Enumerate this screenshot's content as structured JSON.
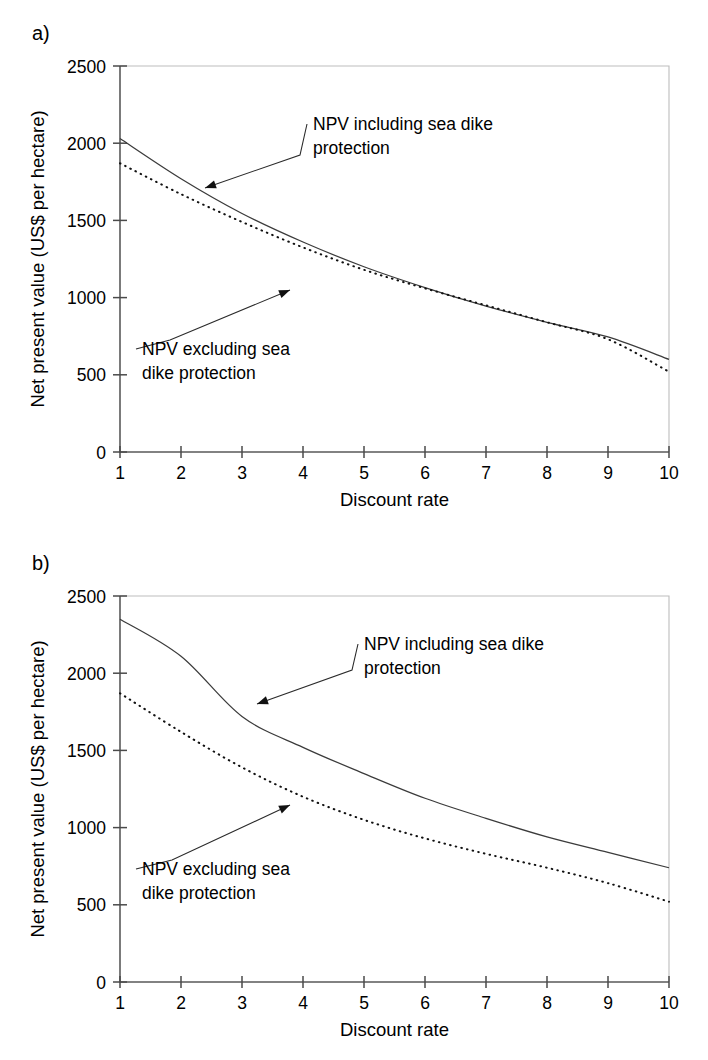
{
  "figure": {
    "panels": [
      {
        "tag": "a)",
        "xlabel": "Discount rate",
        "ylabel": "Net present value (US$ per hectare)",
        "annotations": [
          {
            "line1": "NPV including sea dike",
            "line2": "protection"
          },
          {
            "line1": "NPV excluding sea",
            "line2": "dike protection"
          }
        ]
      },
      {
        "tag": "b)",
        "xlabel": "Discount rate",
        "ylabel": "Net present value (US$ per hectare)",
        "annotations": [
          {
            "line1": "NPV including sea dike",
            "line2": "protection"
          },
          {
            "line1": "NPV excluding sea",
            "line2": "dike protection"
          }
        ]
      }
    ]
  },
  "chart_data": [
    {
      "type": "line",
      "panel": "a)",
      "title": "",
      "xlabel": "Discount rate",
      "ylabel": "Net present value (US$ per hectare)",
      "xlim": [
        1,
        10
      ],
      "ylim": [
        0,
        2500
      ],
      "xticks": [
        1,
        2,
        3,
        4,
        5,
        6,
        7,
        8,
        9,
        10
      ],
      "xticklabels": [
        "1",
        "2",
        "3",
        "4",
        "5",
        "6",
        "7",
        "8",
        "9",
        "10"
      ],
      "yticks": [
        0,
        500,
        1000,
        1500,
        2000,
        2500
      ],
      "yticklabels": [
        "0",
        "500",
        "1000",
        "1500",
        "2000",
        "2500"
      ],
      "grid": false,
      "legend": "annotations-with-leader-lines",
      "x": [
        1,
        2,
        3,
        4,
        5,
        6,
        7,
        8,
        9,
        10
      ],
      "series": [
        {
          "name": "NPV including sea dike protection",
          "style": "solid",
          "values": [
            2030,
            1770,
            1545,
            1360,
            1200,
            1065,
            945,
            840,
            745,
            600
          ]
        },
        {
          "name": "NPV excluding sea dike protection",
          "style": "dotted",
          "values": [
            1870,
            1670,
            1490,
            1325,
            1180,
            1060,
            950,
            840,
            730,
            520
          ]
        }
      ]
    },
    {
      "type": "line",
      "panel": "b)",
      "title": "",
      "xlabel": "Discount rate",
      "ylabel": "Net present value (US$ per hectare)",
      "xlim": [
        1,
        10
      ],
      "ylim": [
        0,
        2500
      ],
      "xticks": [
        1,
        2,
        3,
        4,
        5,
        6,
        7,
        8,
        9,
        10
      ],
      "xticklabels": [
        "1",
        "2",
        "3",
        "4",
        "5",
        "6",
        "7",
        "8",
        "9",
        "10"
      ],
      "yticks": [
        0,
        500,
        1000,
        1500,
        2000,
        2500
      ],
      "yticklabels": [
        "0",
        "500",
        "1000",
        "1500",
        "2000",
        "2500"
      ],
      "grid": false,
      "legend": "annotations-with-leader-lines",
      "x": [
        1,
        2,
        3,
        4,
        5,
        6,
        7,
        8,
        9,
        10
      ],
      "series": [
        {
          "name": "NPV including sea dike protection",
          "style": "solid",
          "values": [
            2350,
            2110,
            1720,
            1520,
            1350,
            1190,
            1060,
            940,
            840,
            740
          ]
        },
        {
          "name": "NPV excluding sea dike protection",
          "style": "dotted",
          "values": [
            1870,
            1620,
            1390,
            1200,
            1050,
            930,
            830,
            740,
            640,
            520
          ]
        }
      ]
    }
  ],
  "colors": {
    "solid_series": "#3b3b3b",
    "dotted_series": "#111111",
    "axis": "#5a5a5a",
    "frame": "#bdbdbd",
    "text": "#000000",
    "background": "#ffffff"
  }
}
